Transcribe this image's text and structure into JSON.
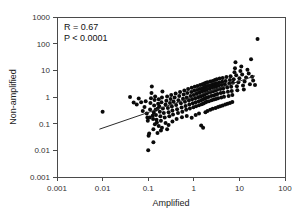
{
  "chart_data": {
    "type": "scatter",
    "title": "",
    "xlabel": "Amplified",
    "ylabel": "Non-amplified",
    "xscale": "log",
    "yscale": "log",
    "xlim": [
      0.001,
      100
    ],
    "ylim": [
      0.001,
      1000
    ],
    "xticks": [
      "0.001",
      "0.01",
      "0.1",
      "1",
      "10",
      "100"
    ],
    "xtick_values": [
      0.001,
      0.01,
      0.1,
      1,
      10,
      100
    ],
    "yticks": [
      "0.001",
      "0.01",
      "0.1",
      "1",
      "10",
      "100",
      "1000"
    ],
    "ytick_values": [
      0.001,
      0.01,
      0.1,
      1,
      10,
      100,
      1000
    ],
    "grid": false,
    "legend": null,
    "annotations": [
      {
        "name": "correlation",
        "text": "R  =  0.67"
      },
      {
        "name": "pvalue",
        "text": "P < 0.0001"
      }
    ],
    "statistics": {
      "R": 0.67,
      "P": "< 0.0001"
    },
    "fit_line": {
      "x": [
        0.0085,
        22.0
      ],
      "y": [
        0.062,
        6.2
      ]
    },
    "marker": {
      "shape": "circle",
      "color": "#0a0a0a",
      "size_px": 4
    },
    "points": [
      [
        0.01,
        0.28
      ],
      [
        0.04,
        1.0
      ],
      [
        0.048,
        0.62
      ],
      [
        0.056,
        0.52
      ],
      [
        0.062,
        0.88
      ],
      [
        0.07,
        0.64
      ],
      [
        0.076,
        0.3
      ],
      [
        0.083,
        0.42
      ],
      [
        0.088,
        0.7
      ],
      [
        0.093,
        0.24
      ],
      [
        0.096,
        0.17
      ],
      [
        0.098,
        0.13
      ],
      [
        0.1,
        0.01
      ],
      [
        0.102,
        0.035
      ],
      [
        0.105,
        0.043
      ],
      [
        0.108,
        0.17
      ],
      [
        0.11,
        0.34
      ],
      [
        0.112,
        0.6
      ],
      [
        0.115,
        0.9
      ],
      [
        0.118,
        1.4
      ],
      [
        0.12,
        2.5
      ],
      [
        0.125,
        0.2
      ],
      [
        0.128,
        0.15
      ],
      [
        0.13,
        0.02
      ],
      [
        0.132,
        0.26
      ],
      [
        0.135,
        0.48
      ],
      [
        0.138,
        0.78
      ],
      [
        0.142,
        1.05
      ],
      [
        0.145,
        0.33
      ],
      [
        0.148,
        0.21
      ],
      [
        0.152,
        0.14
      ],
      [
        0.155,
        0.11
      ],
      [
        0.16,
        0.36
      ],
      [
        0.165,
        0.56
      ],
      [
        0.17,
        0.82
      ],
      [
        0.175,
        0.45
      ],
      [
        0.18,
        0.28
      ],
      [
        0.185,
        0.19
      ],
      [
        0.19,
        0.13
      ],
      [
        0.195,
        0.64
      ],
      [
        0.2,
        0.96
      ],
      [
        0.205,
        1.6
      ],
      [
        0.21,
        0.37
      ],
      [
        0.22,
        0.25
      ],
      [
        0.23,
        0.17
      ],
      [
        0.24,
        0.52
      ],
      [
        0.25,
        0.73
      ],
      [
        0.26,
        1.05
      ],
      [
        0.27,
        0.39
      ],
      [
        0.28,
        0.27
      ],
      [
        0.29,
        0.19
      ],
      [
        0.3,
        0.6
      ],
      [
        0.31,
        0.85
      ],
      [
        0.32,
        1.2
      ],
      [
        0.33,
        0.44
      ],
      [
        0.34,
        0.31
      ],
      [
        0.35,
        0.22
      ],
      [
        0.36,
        0.68
      ],
      [
        0.38,
        0.95
      ],
      [
        0.4,
        1.35
      ],
      [
        0.41,
        0.5
      ],
      [
        0.43,
        0.35
      ],
      [
        0.45,
        0.25
      ],
      [
        0.46,
        0.76
      ],
      [
        0.48,
        1.1
      ],
      [
        0.5,
        1.55
      ],
      [
        0.52,
        0.58
      ],
      [
        0.54,
        0.4
      ],
      [
        0.56,
        0.28
      ],
      [
        0.58,
        0.86
      ],
      [
        0.6,
        1.25
      ],
      [
        0.62,
        1.75
      ],
      [
        0.64,
        0.66
      ],
      [
        0.66,
        0.46
      ],
      [
        0.68,
        0.33
      ],
      [
        0.7,
        0.96
      ],
      [
        0.72,
        1.4
      ],
      [
        0.75,
        2.0
      ],
      [
        0.78,
        0.74
      ],
      [
        0.8,
        0.52
      ],
      [
        0.82,
        0.37
      ],
      [
        0.85,
        1.08
      ],
      [
        0.88,
        1.55
      ],
      [
        0.9,
        2.2
      ],
      [
        0.92,
        0.82
      ],
      [
        0.95,
        0.58
      ],
      [
        0.98,
        0.41
      ],
      [
        1.0,
        1.2
      ],
      [
        1.02,
        1.7
      ],
      [
        1.05,
        2.4
      ],
      [
        1.08,
        0.9
      ],
      [
        1.1,
        0.64
      ],
      [
        1.12,
        0.45
      ],
      [
        1.15,
        1.32
      ],
      [
        1.18,
        1.85
      ],
      [
        1.2,
        2.6
      ],
      [
        1.25,
        0.98
      ],
      [
        1.28,
        0.7
      ],
      [
        1.3,
        0.49
      ],
      [
        1.32,
        1.45
      ],
      [
        1.35,
        2.0
      ],
      [
        1.38,
        2.8
      ],
      [
        1.4,
        1.05
      ],
      [
        1.45,
        0.76
      ],
      [
        1.48,
        0.53
      ],
      [
        1.5,
        1.6
      ],
      [
        1.52,
        2.15
      ],
      [
        1.55,
        3.0
      ],
      [
        1.58,
        1.15
      ],
      [
        1.6,
        0.82
      ],
      [
        1.62,
        0.57
      ],
      [
        1.65,
        1.72
      ],
      [
        1.68,
        2.3
      ],
      [
        1.7,
        3.2
      ],
      [
        1.72,
        1.25
      ],
      [
        1.75,
        0.88
      ],
      [
        1.78,
        0.62
      ],
      [
        1.8,
        1.85
      ],
      [
        1.82,
        2.45
      ],
      [
        1.85,
        3.4
      ],
      [
        1.88,
        1.35
      ],
      [
        1.9,
        0.94
      ],
      [
        1.92,
        0.66
      ],
      [
        1.95,
        1.95
      ],
      [
        1.98,
        2.6
      ],
      [
        2.0,
        3.6
      ],
      [
        2.05,
        1.45
      ],
      [
        2.1,
        1.0
      ],
      [
        2.15,
        0.7
      ],
      [
        2.2,
        2.05
      ],
      [
        2.25,
        2.75
      ],
      [
        2.3,
        3.8
      ],
      [
        2.35,
        1.55
      ],
      [
        2.4,
        1.08
      ],
      [
        2.45,
        0.75
      ],
      [
        2.5,
        2.2
      ],
      [
        2.55,
        2.9
      ],
      [
        2.6,
        4.0
      ],
      [
        2.65,
        1.65
      ],
      [
        2.7,
        1.15
      ],
      [
        2.75,
        0.8
      ],
      [
        2.8,
        2.35
      ],
      [
        2.85,
        3.1
      ],
      [
        2.9,
        4.3
      ],
      [
        2.95,
        1.75
      ],
      [
        3.0,
        1.22
      ],
      [
        3.05,
        0.85
      ],
      [
        3.1,
        2.5
      ],
      [
        3.15,
        3.3
      ],
      [
        3.2,
        4.6
      ],
      [
        3.25,
        1.88
      ],
      [
        3.3,
        1.3
      ],
      [
        3.4,
        0.9
      ],
      [
        3.5,
        2.65
      ],
      [
        3.6,
        3.5
      ],
      [
        3.7,
        4.9
      ],
      [
        3.8,
        2.0
      ],
      [
        3.9,
        1.4
      ],
      [
        4.0,
        0.96
      ],
      [
        4.1,
        2.8
      ],
      [
        4.2,
        3.7
      ],
      [
        4.3,
        5.2
      ],
      [
        4.4,
        2.1
      ],
      [
        4.5,
        1.48
      ],
      [
        4.6,
        1.02
      ],
      [
        4.8,
        3.0
      ],
      [
        5.0,
        4.0
      ],
      [
        5.2,
        5.6
      ],
      [
        5.4,
        2.25
      ],
      [
        5.6,
        1.58
      ],
      [
        5.8,
        1.1
      ],
      [
        6.0,
        3.2
      ],
      [
        6.2,
        4.3
      ],
      [
        6.4,
        6.0
      ],
      [
        6.6,
        2.4
      ],
      [
        6.8,
        1.68
      ],
      [
        7.0,
        1.18
      ],
      [
        7.2,
        3.4
      ],
      [
        7.5,
        4.6
      ],
      [
        7.8,
        8.5
      ],
      [
        8.0,
        12.0
      ],
      [
        8.2,
        20.0
      ],
      [
        8.5,
        6.5
      ],
      [
        8.8,
        2.55
      ],
      [
        9.0,
        1.78
      ],
      [
        9.5,
        3.6
      ],
      [
        10.0,
        5.0
      ],
      [
        10.5,
        9.5
      ],
      [
        11.0,
        14.0
      ],
      [
        11.5,
        7.0
      ],
      [
        12.0,
        2.7
      ],
      [
        12.5,
        1.9
      ],
      [
        13.0,
        3.8
      ],
      [
        14.0,
        5.4
      ],
      [
        15.0,
        10.5
      ],
      [
        16.0,
        7.6
      ],
      [
        17.0,
        3.0
      ],
      [
        18.0,
        26.0
      ],
      [
        19.0,
        5.8
      ],
      [
        20.0,
        4.2
      ],
      [
        22.0,
        2.8
      ],
      [
        25.0,
        150.0
      ],
      [
        0.14,
        0.095
      ],
      [
        0.17,
        0.082
      ],
      [
        0.2,
        0.07
      ],
      [
        0.24,
        0.105
      ],
      [
        0.28,
        0.09
      ],
      [
        0.34,
        0.12
      ],
      [
        0.42,
        0.15
      ],
      [
        0.55,
        0.175
      ],
      [
        0.7,
        0.195
      ],
      [
        0.9,
        0.165
      ],
      [
        1.1,
        0.21
      ],
      [
        1.3,
        0.24
      ],
      [
        1.45,
        0.085
      ],
      [
        1.6,
        0.07
      ],
      [
        1.8,
        0.27
      ],
      [
        2.0,
        0.3
      ],
      [
        2.3,
        0.33
      ],
      [
        2.6,
        0.36
      ],
      [
        3.0,
        0.39
      ],
      [
        3.4,
        0.42
      ],
      [
        3.8,
        0.45
      ],
      [
        4.3,
        0.48
      ],
      [
        4.9,
        0.52
      ],
      [
        5.5,
        0.56
      ],
      [
        6.2,
        0.6
      ],
      [
        7.0,
        0.65
      ],
      [
        0.19,
        0.056
      ],
      [
        0.26,
        0.062
      ],
      [
        0.16,
        0.045
      ],
      [
        0.13,
        0.062
      ]
    ]
  }
}
